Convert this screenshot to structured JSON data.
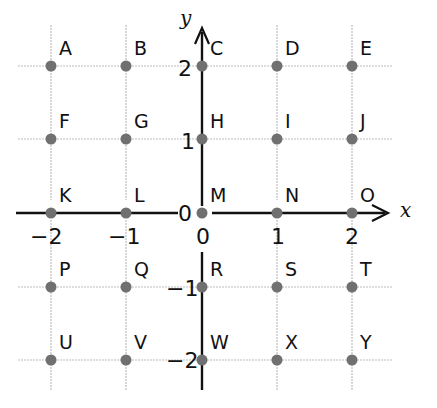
{
  "diagram": {
    "type": "coordinate-grid",
    "axes": {
      "x_label": "x",
      "y_label": "y",
      "x_ticks": [
        "−2",
        "−1",
        "0",
        "1",
        "2"
      ],
      "y_ticks": [
        "2",
        "1",
        "0",
        "−1",
        "−2"
      ],
      "x_range": [
        -2,
        2
      ],
      "y_range": [
        -2,
        2
      ]
    },
    "points": [
      {
        "label": "A",
        "x": -2,
        "y": 2
      },
      {
        "label": "B",
        "x": -1,
        "y": 2
      },
      {
        "label": "C",
        "x": 0,
        "y": 2
      },
      {
        "label": "D",
        "x": 1,
        "y": 2
      },
      {
        "label": "E",
        "x": 2,
        "y": 2
      },
      {
        "label": "F",
        "x": -2,
        "y": 1
      },
      {
        "label": "G",
        "x": -1,
        "y": 1
      },
      {
        "label": "H",
        "x": 0,
        "y": 1
      },
      {
        "label": "I",
        "x": 1,
        "y": 1
      },
      {
        "label": "J",
        "x": 2,
        "y": 1
      },
      {
        "label": "K",
        "x": -2,
        "y": 0
      },
      {
        "label": "L",
        "x": -1,
        "y": 0
      },
      {
        "label": "M",
        "x": 0,
        "y": 0
      },
      {
        "label": "N",
        "x": 1,
        "y": 0
      },
      {
        "label": "O",
        "x": 2,
        "y": 0
      },
      {
        "label": "P",
        "x": -2,
        "y": -1
      },
      {
        "label": "Q",
        "x": -1,
        "y": -1
      },
      {
        "label": "R",
        "x": 0,
        "y": -1
      },
      {
        "label": "S",
        "x": 1,
        "y": -1
      },
      {
        "label": "T",
        "x": 2,
        "y": -1
      },
      {
        "label": "U",
        "x": -2,
        "y": -2
      },
      {
        "label": "V",
        "x": -1,
        "y": -2
      },
      {
        "label": "W",
        "x": 0,
        "y": -2
      },
      {
        "label": "X",
        "x": 1,
        "y": -2
      },
      {
        "label": "Y",
        "x": 2,
        "y": -2
      }
    ],
    "colors": {
      "grid": "#bdbdbd",
      "axis": "#111111",
      "point": "#707070"
    }
  }
}
